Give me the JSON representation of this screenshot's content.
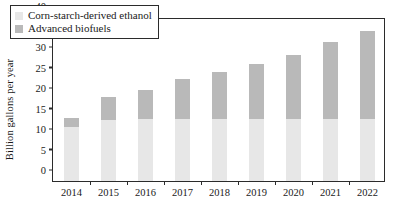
{
  "chart_data": {
    "type": "bar",
    "stacked": true,
    "title": "",
    "xlabel": "",
    "ylabel": "Billion gallons per year",
    "categories": [
      "2014",
      "2015",
      "2016",
      "2017",
      "2018",
      "2019",
      "2020",
      "2021",
      "2022"
    ],
    "series": [
      {
        "name": "Corn-starch-derived ethanol",
        "color": "#e7e7e7",
        "values": [
          13.2,
          15.0,
          15.2,
          15.2,
          15.2,
          15.2,
          15.2,
          15.2,
          15.2
        ]
      },
      {
        "name": "Advanced biofuels",
        "color": "#b9b9b9",
        "values": [
          2.1,
          5.5,
          7.0,
          9.6,
          11.3,
          13.3,
          15.5,
          18.6,
          21.3
        ]
      }
    ],
    "totals": [
      15.3,
      20.5,
      22.2,
      24.8,
      26.5,
      28.5,
      30.7,
      33.8,
      36.5
    ],
    "ylim": [
      0,
      40
    ],
    "yticks": [
      0,
      5,
      10,
      15,
      20,
      25,
      30,
      35,
      40
    ],
    "ytick_labels": [
      "0",
      "5",
      "10",
      "15",
      "20",
      "25",
      "30",
      "35",
      "40"
    ],
    "grid": false,
    "legend_position": "top-left",
    "legend_entries": [
      "Corn-starch-derived ethanol",
      "Advanced biofuels"
    ]
  }
}
